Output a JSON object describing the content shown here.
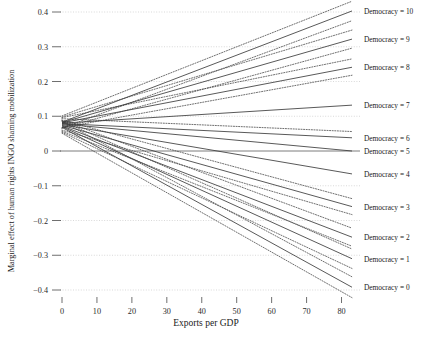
{
  "chart_data": {
    "type": "line",
    "title": "",
    "xlabel": "Exports per GDP",
    "ylabel": "Marginal effect of human rights INGO shaming mobilization",
    "xlim": [
      0,
      83
    ],
    "ylim": [
      -0.42,
      0.41
    ],
    "xticks": [
      0,
      10,
      20,
      30,
      40,
      50,
      60,
      70,
      80
    ],
    "xticklabels": [
      "0",
      "10",
      "20",
      "30",
      "40",
      "50",
      "60",
      "70",
      "80"
    ],
    "yticks": [
      0.4,
      0.3,
      0.2,
      0.1,
      0,
      -0.1,
      -0.2,
      -0.3,
      -0.4
    ],
    "yticklabels": [
      "0.4",
      "0.3",
      "0.2",
      "0.1",
      "0",
      "−0.1",
      "−0.2",
      "−0.3",
      "−0.4"
    ],
    "grid": true,
    "zero_reference_line": 0,
    "legend_position": "right",
    "x": [
      0,
      83
    ],
    "series": [
      {
        "name": "Democracy = 10",
        "label": "Democracy = 10",
        "values": [
          0.083,
          0.403
        ],
        "ci_upper": [
          0.101,
          0.431
        ],
        "ci_lower": [
          0.066,
          0.375
        ],
        "ci_style": "dotted"
      },
      {
        "name": "Democracy = 9",
        "label": "Democracy = 9",
        "values": [
          0.082,
          0.322
        ],
        "ci_upper": [
          0.098,
          0.348
        ],
        "ci_lower": [
          0.066,
          0.296
        ],
        "ci_style": "dotted"
      },
      {
        "name": "Democracy = 8",
        "label": "Democracy = 8",
        "values": [
          0.081,
          0.241
        ],
        "ci_upper": [
          0.096,
          0.265
        ],
        "ci_lower": [
          0.067,
          0.218
        ],
        "ci_style": "dotted"
      },
      {
        "name": "Democracy = 7",
        "label": "Democracy = 7",
        "values": [
          0.08,
          0.132
        ],
        "ci_upper": [
          0.094,
          0.152
        ],
        "ci_lower": [
          0.067,
          0.112
        ],
        "ci_style": "none"
      },
      {
        "name": "Democracy = 6",
        "label": "Democracy = 6",
        "values": [
          0.079,
          0.038
        ],
        "ci_upper": [
          0.093,
          0.056
        ],
        "ci_lower": [
          0.066,
          0.021
        ],
        "ci_style": "dotted-upper"
      },
      {
        "name": "Democracy = 5",
        "label": "Democracy = 5",
        "values": [
          0.078,
          0.0
        ],
        "ci_upper": [
          0.092,
          0.016
        ],
        "ci_lower": [
          0.065,
          -0.014
        ],
        "ci_style": "none"
      },
      {
        "name": "Democracy = 4",
        "label": "Democracy = 4",
        "values": [
          0.076,
          -0.066
        ],
        "ci_upper": [
          0.09,
          -0.048
        ],
        "ci_lower": [
          0.063,
          -0.084
        ],
        "ci_style": "none"
      },
      {
        "name": "Democracy = 3",
        "label": "Democracy = 3",
        "values": [
          0.074,
          -0.16
        ],
        "ci_upper": [
          0.089,
          -0.137
        ],
        "ci_lower": [
          0.06,
          -0.183
        ],
        "ci_style": "dotted"
      },
      {
        "name": "Democracy = 2",
        "label": "Democracy = 2",
        "values": [
          0.072,
          -0.248
        ],
        "ci_upper": [
          0.088,
          -0.222
        ],
        "ci_lower": [
          0.057,
          -0.274
        ],
        "ci_style": "dotted"
      },
      {
        "name": "Democracy = 1",
        "label": "Democracy = 1",
        "values": [
          0.07,
          -0.31
        ],
        "ci_upper": [
          0.086,
          -0.282
        ],
        "ci_lower": [
          0.054,
          -0.338
        ],
        "ci_style": "dotted"
      },
      {
        "name": "Democracy = 0",
        "label": "Democracy = 0",
        "values": [
          0.068,
          -0.392
        ],
        "ci_upper": [
          0.085,
          -0.362
        ],
        "ci_lower": [
          0.051,
          -0.422
        ],
        "ci_style": "dotted"
      }
    ],
    "colors": {
      "line": "#3b3b3b",
      "ci": "#4a4a4a",
      "grid": "#c9c9c9",
      "zero": "#6e6e6e"
    }
  }
}
